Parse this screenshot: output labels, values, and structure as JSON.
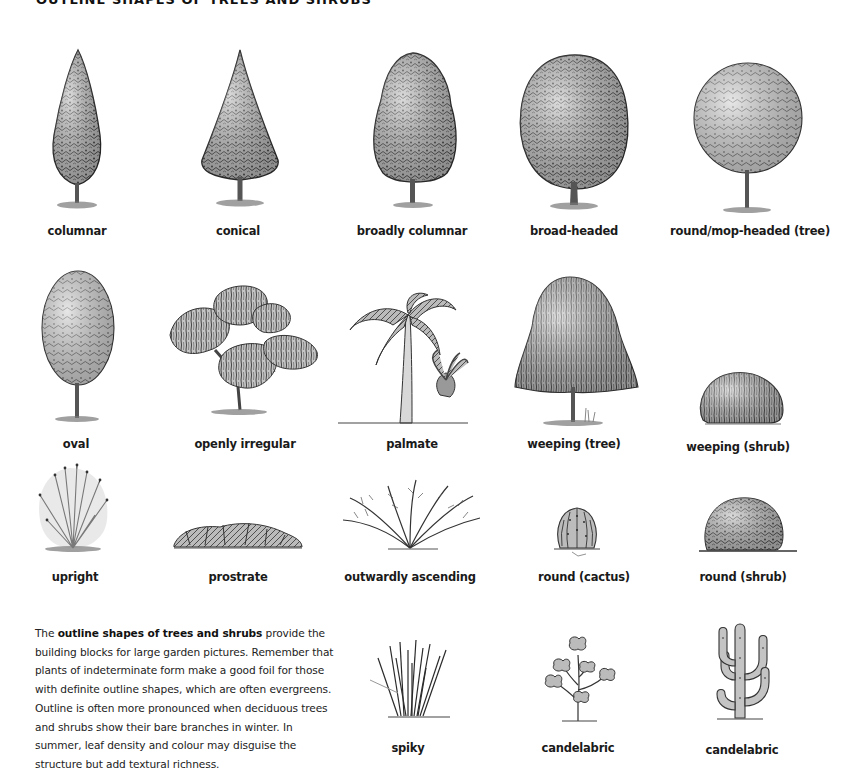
{
  "page": {
    "title": "OUTLINE SHAPES OF TREES AND SHRUBS"
  },
  "rows": [
    {
      "items": [
        {
          "id": "columnar",
          "label": "columnar",
          "kind": "tree"
        },
        {
          "id": "conical",
          "label": "conical",
          "kind": "tree"
        },
        {
          "id": "broadly-columnar",
          "label": "broadly columnar",
          "kind": "tree"
        },
        {
          "id": "broad-headed",
          "label": "broad-headed",
          "kind": "tree"
        },
        {
          "id": "round-mop-headed-tree",
          "label": "round/mop-headed (tree)",
          "kind": "tree"
        }
      ]
    },
    {
      "items": [
        {
          "id": "oval",
          "label": "oval",
          "kind": "tree"
        },
        {
          "id": "openly-irregular",
          "label": "openly irregular",
          "kind": "tree"
        },
        {
          "id": "palmate",
          "label": "palmate",
          "kind": "palm"
        },
        {
          "id": "weeping-tree",
          "label": "weeping (tree)",
          "kind": "tree"
        },
        {
          "id": "weeping-shrub",
          "label": "weeping (shrub)",
          "kind": "shrub"
        }
      ]
    },
    {
      "items": [
        {
          "id": "upright",
          "label": "upright",
          "kind": "shrub"
        },
        {
          "id": "prostrate",
          "label": "prostrate",
          "kind": "shrub"
        },
        {
          "id": "outwardly-ascending",
          "label": "outwardly ascending",
          "kind": "shrub"
        },
        {
          "id": "round-cactus",
          "label": "round (cactus)",
          "kind": "cactus"
        },
        {
          "id": "round-shrub",
          "label": "round (shrub)",
          "kind": "shrub"
        }
      ]
    },
    {
      "items": [
        {
          "id": "spiky",
          "label": "spiky",
          "kind": "grass"
        },
        {
          "id": "candelabric-1",
          "label": "candelabric",
          "kind": "succulent"
        },
        {
          "id": "candelabric-2",
          "label": "candelabric",
          "kind": "cactus"
        }
      ]
    }
  ],
  "paragraph": {
    "lead": "The ",
    "bold": "outline shapes of trees and shrubs",
    "rest": " provide the building blocks for large garden pictures. Remember that plants of indeterminate form make a good foil for those with definite outline shapes, which are often evergreens. Outline is often more pronounced when deciduous trees and shrubs show their bare branches in winter. In summer, leaf density and colour may disguise the structure but add textural richness."
  },
  "style": {
    "ink": "#2a2a2a",
    "foliage_mid": "#8a8a8a",
    "foliage_light": "#c9c9c9",
    "ground": "#555555",
    "text": "#1a1a1a"
  }
}
